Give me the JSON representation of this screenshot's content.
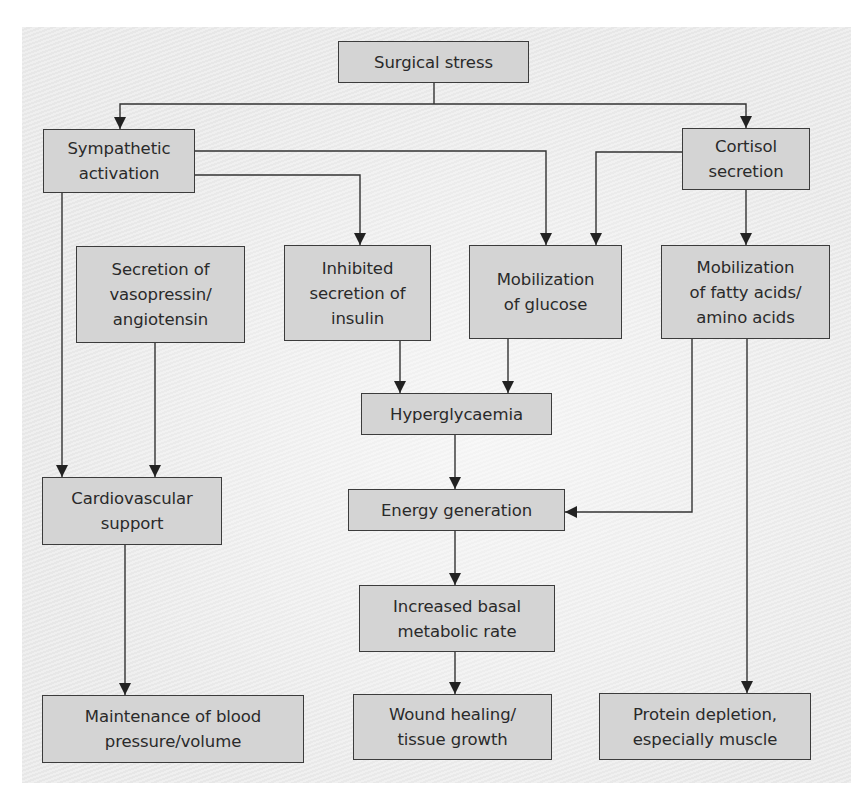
{
  "diagram": {
    "type": "flowchart",
    "colors": {
      "box_fill": "#d4d4d4",
      "box_border": "#3c3c3c",
      "text": "#2a2a2a",
      "panel_background": "#ebebeb",
      "arrow": "#333333"
    },
    "nodes": {
      "surgical_stress": "Surgical stress",
      "sympathetic_activation": "Sympathetic\nactivation",
      "cortisol_secretion": "Cortisol\nsecretion",
      "vasopressin": "Secretion of\nvasopressin/\nangiotensin",
      "inhibited_insulin": "Inhibited\nsecretion of\ninsulin",
      "mobilization_glucose": "Mobilization\nof glucose",
      "mobilization_fatty_acids": "Mobilization\nof fatty acids/\namino acids",
      "hyperglycaemia": "Hyperglycaemia",
      "cardiovascular_support": "Cardiovascular\nsupport",
      "energy_generation": "Energy generation",
      "increased_bmr": "Increased basal\nmetabolic rate",
      "maintenance_bp": "Maintenance of blood\npressure/volume",
      "wound_healing": "Wound healing/\ntissue growth",
      "protein_depletion": "Protein depletion,\nespecially muscle"
    },
    "edges": [
      {
        "from": "Surgical stress",
        "to": "Sympathetic activation"
      },
      {
        "from": "Surgical stress",
        "to": "Cortisol secretion"
      },
      {
        "from": "Sympathetic activation",
        "to": "Cardiovascular support"
      },
      {
        "from": "Sympathetic activation",
        "to": "Inhibited secretion of insulin"
      },
      {
        "from": "Sympathetic activation",
        "to": "Mobilization of glucose"
      },
      {
        "from": "Cortisol secretion",
        "to": "Mobilization of glucose"
      },
      {
        "from": "Cortisol secretion",
        "to": "Mobilization of fatty acids/amino acids"
      },
      {
        "from": "Secretion of vasopressin/angiotensin",
        "to": "Cardiovascular support"
      },
      {
        "from": "Inhibited secretion of insulin",
        "to": "Hyperglycaemia"
      },
      {
        "from": "Mobilization of glucose",
        "to": "Hyperglycaemia"
      },
      {
        "from": "Hyperglycaemia",
        "to": "Energy generation"
      },
      {
        "from": "Mobilization of fatty acids/amino acids",
        "to": "Energy generation"
      },
      {
        "from": "Mobilization of fatty acids/amino acids",
        "to": "Protein depletion, especially muscle"
      },
      {
        "from": "Energy generation",
        "to": "Increased basal metabolic rate"
      },
      {
        "from": "Increased basal metabolic rate",
        "to": "Wound healing/tissue growth"
      },
      {
        "from": "Cardiovascular support",
        "to": "Maintenance of blood pressure/volume"
      }
    ]
  }
}
